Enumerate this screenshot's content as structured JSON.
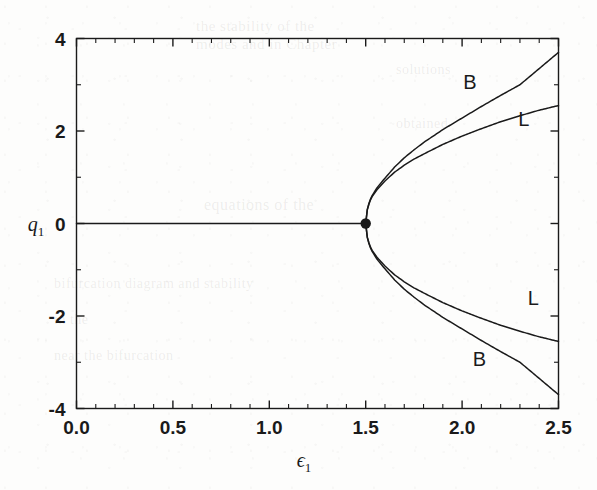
{
  "figure": {
    "background_color": "#fdfdfc",
    "ink_color": "#1a1a1a"
  },
  "chart_data": {
    "type": "line",
    "title": "",
    "subtitle": "",
    "xlabel": "ϵ",
    "xlabel_sub": "1",
    "ylabel": "q",
    "ylabel_sub": "1",
    "xlim": [
      0.0,
      2.5
    ],
    "ylim": [
      -4,
      4
    ],
    "grid": false,
    "legend": "inline-curve-labels",
    "xticks": [
      0.0,
      0.5,
      1.0,
      1.5,
      2.0,
      2.5
    ],
    "xtick_labels": [
      "0.0",
      "0.5",
      "1.0",
      "1.5",
      "2.0",
      "2.5"
    ],
    "yticks": [
      -4,
      -2,
      0,
      2,
      4
    ],
    "ytick_labels": [
      "-4",
      "-2",
      "0",
      "2",
      "4"
    ],
    "x_minor_ticks": [
      0.1,
      0.2,
      0.3,
      0.4,
      0.6,
      0.7,
      0.8,
      0.9,
      1.1,
      1.2,
      1.3,
      1.4,
      1.6,
      1.7,
      1.8,
      1.9,
      2.1,
      2.2,
      2.3,
      2.4
    ],
    "y_minor_ticks": [
      -3,
      -1,
      1,
      3
    ],
    "annotations": [
      {
        "text": "B",
        "x": 2.04,
        "y": 3.05,
        "note": "upper outer branch label"
      },
      {
        "text": "L",
        "x": 2.32,
        "y": 2.27,
        "note": "upper inner branch label"
      },
      {
        "text": "L",
        "x": 2.37,
        "y": -1.62,
        "note": "lower inner branch label"
      },
      {
        "text": "B",
        "x": 2.09,
        "y": -2.93,
        "note": "lower outer branch label"
      }
    ],
    "bifurcation_point": {
      "x": 1.5,
      "y": 0.0,
      "marker": "filled-circle"
    },
    "series": [
      {
        "name": "trivial-branch",
        "label": "",
        "x": [
          0.0,
          0.25,
          0.5,
          0.75,
          1.0,
          1.25,
          1.5
        ],
        "values": [
          0.0,
          0.0,
          0.0,
          0.0,
          0.0,
          0.0,
          0.0
        ]
      },
      {
        "name": "B-upper",
        "label": "B",
        "x": [
          1.5,
          1.53,
          1.56,
          1.6,
          1.65,
          1.7,
          1.75,
          1.8,
          1.9,
          2.0,
          2.1,
          2.2,
          2.3,
          2.4,
          2.5
        ],
        "values": [
          0.0,
          0.58,
          0.78,
          0.98,
          1.22,
          1.42,
          1.59,
          1.75,
          2.03,
          2.28,
          2.53,
          2.77,
          3.0,
          3.35,
          3.7
        ]
      },
      {
        "name": "L-upper",
        "label": "L",
        "x": [
          1.5,
          1.53,
          1.56,
          1.6,
          1.65,
          1.7,
          1.75,
          1.8,
          1.9,
          2.0,
          2.1,
          2.2,
          2.3,
          2.4,
          2.5
        ],
        "values": [
          0.0,
          0.56,
          0.74,
          0.92,
          1.11,
          1.26,
          1.39,
          1.5,
          1.71,
          1.89,
          2.05,
          2.2,
          2.33,
          2.45,
          2.55
        ]
      },
      {
        "name": "L-lower",
        "label": "L",
        "x": [
          1.5,
          1.53,
          1.56,
          1.6,
          1.65,
          1.7,
          1.75,
          1.8,
          1.9,
          2.0,
          2.1,
          2.2,
          2.3,
          2.4,
          2.5
        ],
        "values": [
          0.0,
          -0.56,
          -0.74,
          -0.92,
          -1.11,
          -1.26,
          -1.39,
          -1.5,
          -1.71,
          -1.89,
          -2.05,
          -2.2,
          -2.33,
          -2.45,
          -2.55
        ]
      },
      {
        "name": "B-lower",
        "label": "B",
        "x": [
          1.5,
          1.53,
          1.56,
          1.6,
          1.65,
          1.7,
          1.75,
          1.8,
          1.9,
          2.0,
          2.1,
          2.2,
          2.3,
          2.4,
          2.5
        ],
        "values": [
          0.0,
          -0.58,
          -0.78,
          -0.98,
          -1.22,
          -1.42,
          -1.59,
          -1.75,
          -2.03,
          -2.28,
          -2.53,
          -2.77,
          -3.0,
          -3.35,
          -3.7
        ]
      }
    ]
  },
  "ghost_text": {
    "lines": [
      {
        "text": "the stability of the",
        "x": 196,
        "y": 18,
        "size": 15
      },
      {
        "text": "modes and in Chapter",
        "x": 196,
        "y": 36,
        "size": 15
      },
      {
        "text": "equations of the",
        "x": 204,
        "y": 196,
        "size": 16
      },
      {
        "text": "bifurcation diagram and stability",
        "x": 54,
        "y": 276,
        "size": 14
      },
      {
        "text": "in the",
        "x": 54,
        "y": 312,
        "size": 14
      },
      {
        "text": "near the bifurcation",
        "x": 54,
        "y": 348,
        "size": 14
      },
      {
        "text": "solutions",
        "x": 396,
        "y": 62,
        "size": 14
      },
      {
        "text": "obtained",
        "x": 396,
        "y": 116,
        "size": 14
      }
    ]
  }
}
